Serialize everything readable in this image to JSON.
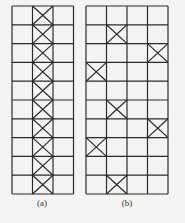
{
  "figure": {
    "panels": [
      {
        "label": "(a)",
        "rows": 10,
        "cols": 3,
        "crossed_cells": [
          [
            0,
            1
          ],
          [
            1,
            1
          ],
          [
            2,
            1
          ],
          [
            3,
            1
          ],
          [
            4,
            1
          ],
          [
            5,
            1
          ],
          [
            6,
            1
          ],
          [
            7,
            1
          ],
          [
            8,
            1
          ],
          [
            9,
            1
          ]
        ]
      },
      {
        "label": "(b)",
        "rows": 10,
        "cols": 4,
        "crossed_cells": [
          [
            1,
            1
          ],
          [
            2,
            3
          ],
          [
            3,
            0
          ],
          [
            5,
            1
          ],
          [
            6,
            3
          ],
          [
            7,
            0
          ],
          [
            9,
            1
          ]
        ]
      }
    ],
    "line_color": "#2a2a2a",
    "background": "#f4f4f2"
  }
}
